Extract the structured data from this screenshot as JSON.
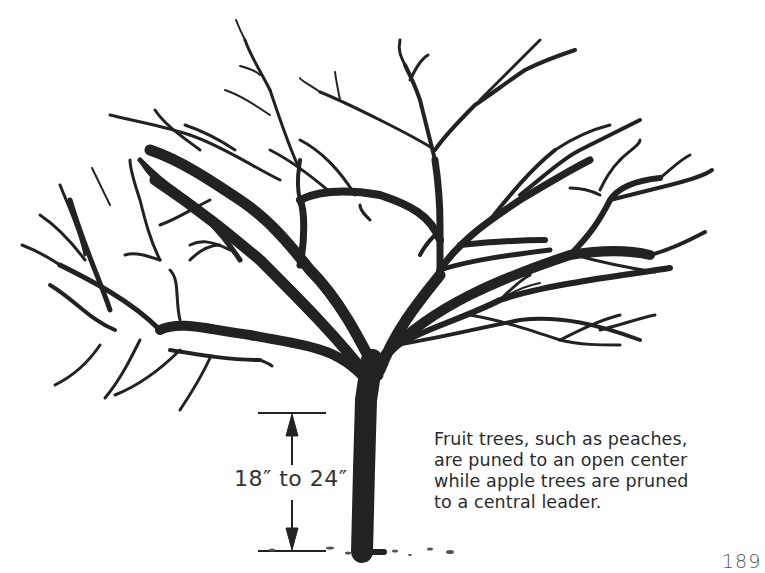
{
  "illustration": {
    "subject": "pruned open-center fruit tree",
    "measurement": {
      "label": "18″ to 24″",
      "description": "height from ground to first scaffold branches"
    }
  },
  "caption": {
    "lines": [
      "Fruit trees, such as peaches,",
      "are puned to an open center",
      "while apple trees are pruned",
      "to a central leader."
    ]
  },
  "page": {
    "number": "189"
  },
  "colors": {
    "ink": "#222222",
    "background": "#ffffff"
  }
}
